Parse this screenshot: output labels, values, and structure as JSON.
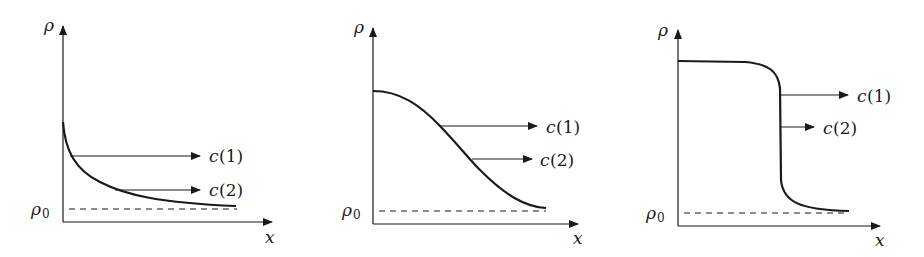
{
  "figure": {
    "panels": [
      {
        "id": "panel-1",
        "y_axis_label": "ρ",
        "x_axis_label": "x",
        "baseline_label": "ρ",
        "baseline_subscript": "0",
        "arrow_labels": [
          {
            "name": "c",
            "arg": "(1)"
          },
          {
            "name": "c",
            "arg": "(2)"
          }
        ],
        "shape": "convex decay from a finite value toward ρ0"
      },
      {
        "id": "panel-2",
        "y_axis_label": "ρ",
        "x_axis_label": "x",
        "baseline_label": "ρ",
        "baseline_subscript": "0",
        "arrow_labels": [
          {
            "name": "c",
            "arg": "(1)"
          },
          {
            "name": "c",
            "arg": "(2)"
          }
        ],
        "shape": "smooth sigmoid decay toward ρ0"
      },
      {
        "id": "panel-3",
        "y_axis_label": "ρ",
        "x_axis_label": "x",
        "baseline_label": "ρ",
        "baseline_subscript": "0",
        "arrow_labels": [
          {
            "name": "c",
            "arg": "(1)"
          },
          {
            "name": "c",
            "arg": "(2)"
          }
        ],
        "shape": "steep step-like front dropping to ρ0"
      }
    ],
    "colors": {
      "line": "#1a1a1a",
      "background": "#ffffff"
    }
  }
}
